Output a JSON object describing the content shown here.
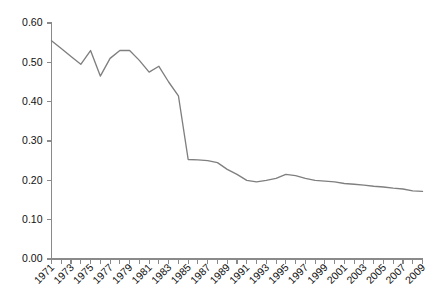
{
  "chart_data": {
    "type": "line",
    "title": "",
    "subtitle": "",
    "xlabel": "",
    "ylabel": "",
    "grid": false,
    "legend": false,
    "legend_position": "none",
    "line_color": "#7f7f7f",
    "axis_color": "#8a8a8a",
    "text_color": "#111111",
    "background_color": "#ffffff",
    "xlim": [
      1971,
      2009
    ],
    "ylim": [
      0.0,
      0.6
    ],
    "x": [
      1971,
      1972,
      1973,
      1974,
      1975,
      1976,
      1977,
      1978,
      1979,
      1980,
      1981,
      1982,
      1983,
      1984,
      1985,
      1986,
      1987,
      1988,
      1989,
      1990,
      1991,
      1992,
      1993,
      1994,
      1995,
      1996,
      1997,
      1998,
      1999,
      2000,
      2001,
      2002,
      2003,
      2004,
      2005,
      2006,
      2007,
      2008,
      2009
    ],
    "values": [
      0.555,
      0.535,
      0.515,
      0.495,
      0.53,
      0.465,
      0.51,
      0.53,
      0.53,
      0.505,
      0.475,
      0.49,
      0.45,
      0.415,
      0.253,
      0.252,
      0.25,
      0.245,
      0.228,
      0.215,
      0.2,
      0.196,
      0.2,
      0.205,
      0.215,
      0.212,
      0.205,
      0.2,
      0.198,
      0.196,
      0.192,
      0.19,
      0.188,
      0.185,
      0.183,
      0.18,
      0.178,
      0.173,
      0.172
    ],
    "y_ticks": [
      0.0,
      0.1,
      0.2,
      0.3,
      0.4,
      0.5,
      0.6
    ],
    "y_tick_labels": [
      "0.00",
      "0.10",
      "0.20",
      "0.30",
      "0.40",
      "0.50",
      "0.60"
    ],
    "x_tick_labels": [
      "1971",
      "1973",
      "1975",
      "1977",
      "1979",
      "1981",
      "1983",
      "1985",
      "1987",
      "1989",
      "1991",
      "1993",
      "1995",
      "1997",
      "1999",
      "2001",
      "2003",
      "2005",
      "2007",
      "2009"
    ],
    "x_tick_label_rotation": -45
  }
}
